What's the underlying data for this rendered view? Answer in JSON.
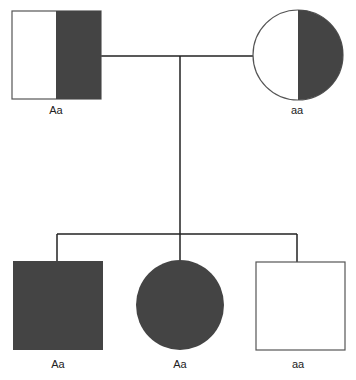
{
  "diagram": {
    "type": "pedigree",
    "colors": {
      "affected": "#444444",
      "outline": "#555555",
      "line": "#222222",
      "background": "#ffffff"
    },
    "parents": [
      {
        "id": "father",
        "sex": "male",
        "shading": "half",
        "genotype": "Aa"
      },
      {
        "id": "mother",
        "sex": "female",
        "shading": "half",
        "genotype": "aa"
      }
    ],
    "children": [
      {
        "id": "son-1",
        "sex": "male",
        "shading": "full",
        "genotype": "Aa"
      },
      {
        "id": "daughter-1",
        "sex": "female",
        "shading": "full",
        "genotype": "Aa"
      },
      {
        "id": "son-2",
        "sex": "male",
        "shading": "none",
        "genotype": "aa"
      }
    ]
  }
}
